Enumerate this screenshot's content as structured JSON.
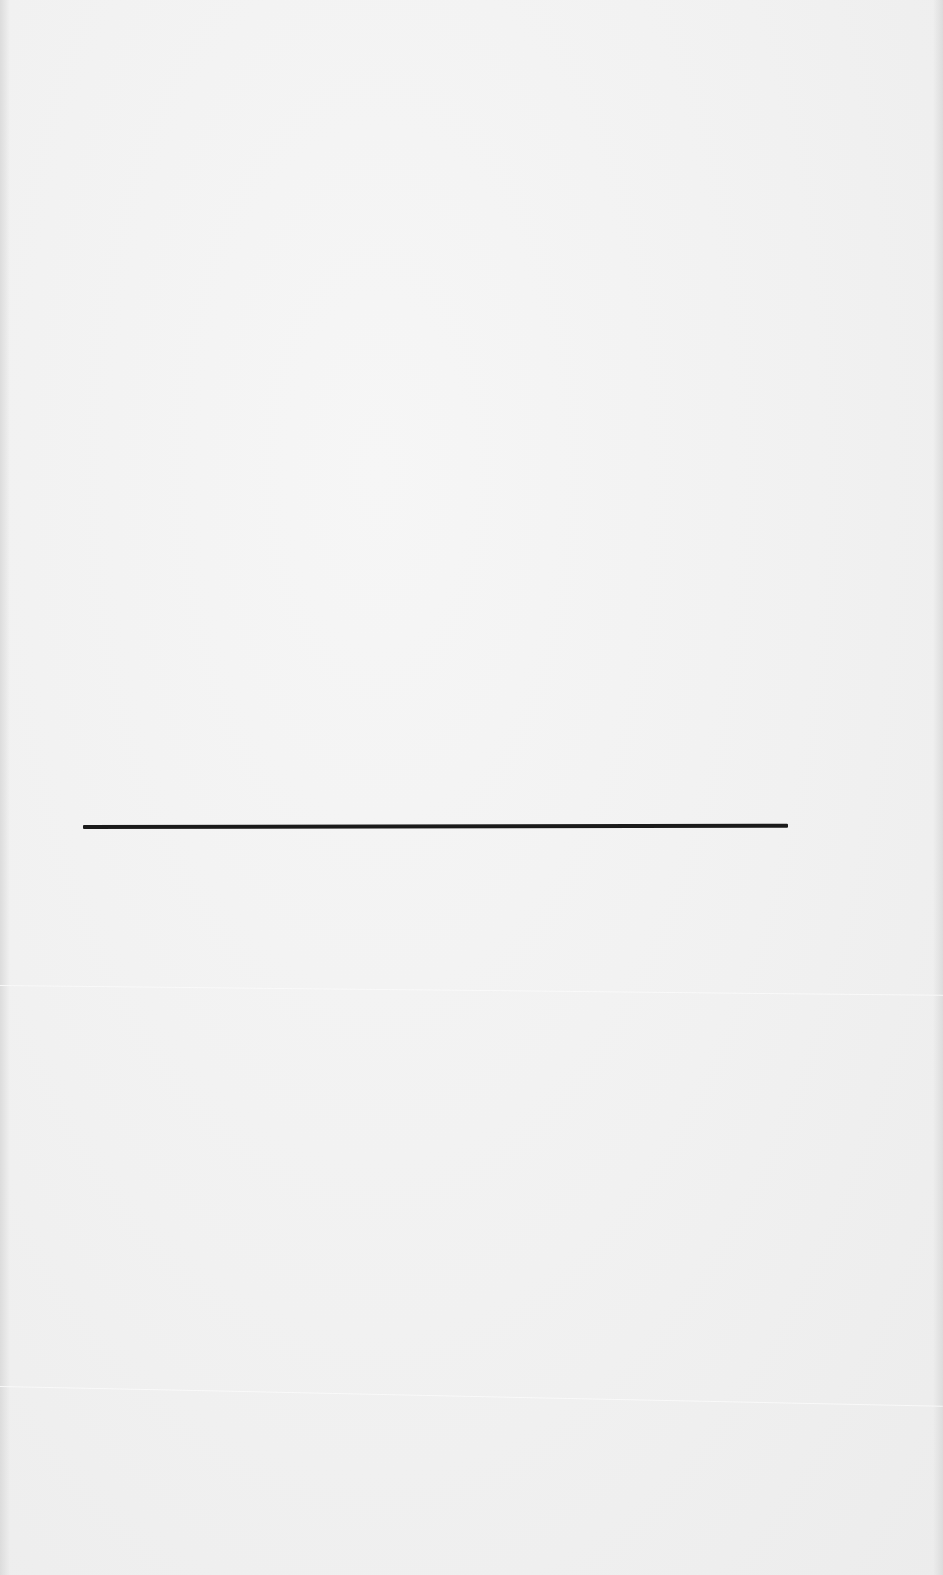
{
  "page": {
    "type": "blank scanned page",
    "background_color": "#f1f1f1",
    "rule": {
      "color": "#1a1a1a",
      "x_start": 83,
      "x_end": 788,
      "y": 827,
      "thickness": 4
    }
  }
}
